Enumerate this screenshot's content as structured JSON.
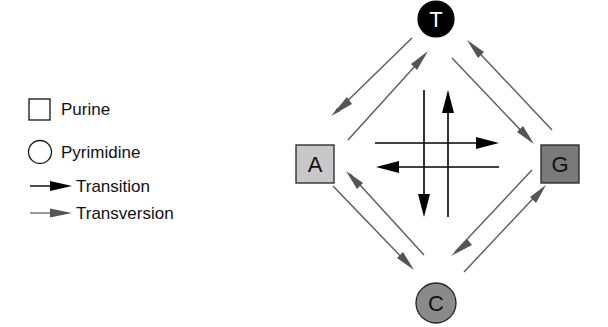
{
  "legend": {
    "items": [
      {
        "symbol": "square",
        "label": "Purine"
      },
      {
        "symbol": "circle",
        "label": "Pyrimidine"
      },
      {
        "symbol": "black-arrow",
        "label": "Transition"
      },
      {
        "symbol": "gray-arrow",
        "label": "Transversion"
      }
    ]
  },
  "nodes": {
    "T": {
      "label": "T",
      "type": "pyrimidine",
      "fill": "#000000",
      "text_color": "#ffffff"
    },
    "A": {
      "label": "A",
      "type": "purine",
      "fill": "#c8c8c8",
      "text_color": "#111111"
    },
    "G": {
      "label": "G",
      "type": "purine",
      "fill": "#7a7a7a",
      "text_color": "#111111"
    },
    "C": {
      "label": "C",
      "type": "pyrimidine",
      "fill": "#8a8a8a",
      "text_color": "#111111"
    }
  },
  "colors": {
    "transition": "#000000",
    "transversion": "#5a5a5a"
  },
  "edges": {
    "transitions": [
      {
        "from": "A",
        "to": "G"
      },
      {
        "from": "G",
        "to": "A"
      },
      {
        "from": "T",
        "to": "C"
      },
      {
        "from": "C",
        "to": "T"
      }
    ],
    "transversions": [
      {
        "from": "T",
        "to": "A"
      },
      {
        "from": "A",
        "to": "T"
      },
      {
        "from": "T",
        "to": "G"
      },
      {
        "from": "G",
        "to": "T"
      },
      {
        "from": "A",
        "to": "C"
      },
      {
        "from": "C",
        "to": "A"
      },
      {
        "from": "G",
        "to": "C"
      },
      {
        "from": "C",
        "to": "G"
      }
    ]
  }
}
